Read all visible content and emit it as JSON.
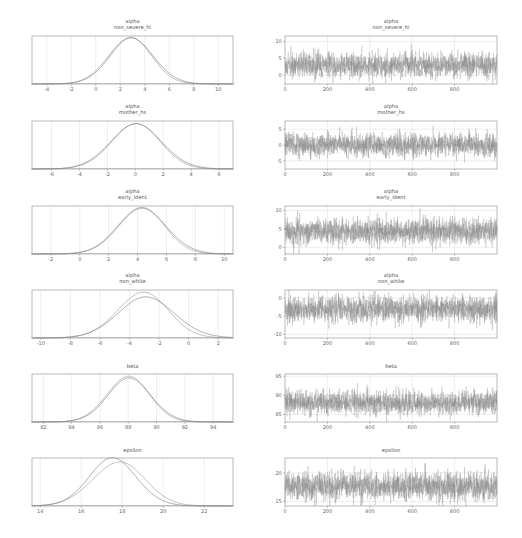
{
  "figure": {
    "width": 522,
    "height": 538,
    "background": "#ffffff",
    "rows": 6,
    "columns": 2,
    "column_kinds": [
      "kde",
      "trace"
    ]
  },
  "style": {
    "frame_color": "#8a8a8a",
    "grid_color": "#d8d8d8",
    "text_color": "#555555",
    "tick_color": "#666666",
    "chain_colors": [
      "#9a9a9a",
      "#7e7e7e"
    ]
  },
  "chart_data": [
    {
      "type": "line",
      "panel": "kde",
      "row": 0,
      "title": "alpha\nnon_severe_hi",
      "title_lines": [
        "alpha",
        "non_severe_hi"
      ],
      "xlabel": "",
      "ylabel": "",
      "xlim": [
        -5.2,
        11.2
      ],
      "ylim": [
        0,
        0.235
      ],
      "xticks": [
        -4,
        -2,
        0,
        2,
        4,
        6,
        8,
        10
      ],
      "xticklabels": [
        "-4",
        "-2",
        "0",
        "2",
        "4",
        "6",
        "8",
        "10"
      ],
      "grid": true,
      "series": [
        {
          "name": "chain 0",
          "kind": "normal-kde",
          "mean": 2.75,
          "sd": 1.75,
          "peak": 0.228
        },
        {
          "name": "chain 1",
          "kind": "normal-kde",
          "mean": 2.95,
          "sd": 1.82,
          "peak": 0.219
        }
      ]
    },
    {
      "type": "line",
      "panel": "trace",
      "row": 0,
      "title": "alpha\nnon_severe_hi",
      "title_lines": [
        "alpha",
        "non_severe_hi"
      ],
      "xlabel": "",
      "ylabel": "",
      "xlim": [
        0,
        1000
      ],
      "ylim": [
        -2.6,
        11.6
      ],
      "xticks": [
        0,
        200,
        400,
        600,
        800
      ],
      "xticklabels": [
        "0",
        "200",
        "400",
        "600",
        "800"
      ],
      "yticks": [
        0,
        5,
        10
      ],
      "yticklabels": [
        "0",
        "5",
        "10"
      ],
      "grid": true,
      "series": [
        {
          "name": "chain 0",
          "kind": "noise",
          "mean": 2.75,
          "sd": 1.75,
          "n": 1000,
          "seed": 11
        },
        {
          "name": "chain 1",
          "kind": "noise",
          "mean": 2.95,
          "sd": 1.82,
          "n": 1000,
          "seed": 12
        }
      ]
    },
    {
      "type": "line",
      "panel": "kde",
      "row": 1,
      "title": "alpha\nmother_hs",
      "title_lines": [
        "alpha",
        "mother_hs"
      ],
      "xlabel": "",
      "ylabel": "",
      "xlim": [
        -7.4,
        7.0
      ],
      "ylim": [
        0,
        0.25
      ],
      "xticks": [
        -6,
        -4,
        -2,
        0,
        2,
        4,
        6
      ],
      "xticklabels": [
        "-6",
        "-4",
        "-2",
        "0",
        "2",
        "4",
        "6"
      ],
      "grid": true,
      "series": [
        {
          "name": "chain 0",
          "kind": "normal-kde",
          "mean": -0.05,
          "sd": 1.78,
          "peak": 0.236
        },
        {
          "name": "chain 1",
          "kind": "normal-kde",
          "mean": 0.12,
          "sd": 1.84,
          "peak": 0.229
        }
      ]
    },
    {
      "type": "line",
      "panel": "trace",
      "row": 1,
      "title": "alpha\nmother_hs",
      "title_lines": [
        "alpha",
        "mother_hs"
      ],
      "xlabel": "",
      "ylabel": "",
      "xlim": [
        0,
        1000
      ],
      "ylim": [
        -7.6,
        7.6
      ],
      "xticks": [
        0,
        200,
        400,
        600,
        800
      ],
      "xticklabels": [
        "0",
        "200",
        "400",
        "600",
        "800"
      ],
      "yticks": [
        -5,
        0,
        5
      ],
      "yticklabels": [
        "-5",
        "0",
        "5"
      ],
      "grid": true,
      "series": [
        {
          "name": "chain 0",
          "kind": "noise",
          "mean": -0.05,
          "sd": 1.78,
          "n": 1000,
          "seed": 21
        },
        {
          "name": "chain 1",
          "kind": "noise",
          "mean": 0.12,
          "sd": 1.84,
          "n": 1000,
          "seed": 22
        }
      ]
    },
    {
      "type": "line",
      "panel": "kde",
      "row": 2,
      "title": "alpha\nearly_ident",
      "title_lines": [
        "alpha",
        "early_ident"
      ],
      "xlabel": "",
      "ylabel": "",
      "xlim": [
        -3.3,
        10.6
      ],
      "ylim": [
        0,
        0.26
      ],
      "xticks": [
        -2,
        0,
        2,
        4,
        6,
        8,
        10
      ],
      "xticklabels": [
        "-2",
        "0",
        "2",
        "4",
        "6",
        "8",
        "10"
      ],
      "grid": true,
      "series": [
        {
          "name": "chain 0",
          "kind": "normal-kde",
          "mean": 4.2,
          "sd": 1.62,
          "peak": 0.252
        },
        {
          "name": "chain 1",
          "kind": "normal-kde",
          "mean": 4.35,
          "sd": 1.7,
          "peak": 0.241
        }
      ]
    },
    {
      "type": "line",
      "panel": "trace",
      "row": 2,
      "title": "alpha\nearly_ident",
      "title_lines": [
        "alpha",
        "early_ident"
      ],
      "xlabel": "",
      "ylabel": "",
      "xlim": [
        0,
        1000
      ],
      "ylim": [
        -1.8,
        11.2
      ],
      "xticks": [
        0,
        200,
        400,
        600,
        800
      ],
      "xticklabels": [
        "0",
        "200",
        "400",
        "600",
        "800"
      ],
      "yticks": [
        0,
        5,
        10
      ],
      "yticklabels": [
        "0",
        "5",
        "10"
      ],
      "grid": true,
      "series": [
        {
          "name": "chain 0",
          "kind": "noise",
          "mean": 4.2,
          "sd": 1.62,
          "n": 1000,
          "seed": 31
        },
        {
          "name": "chain 1",
          "kind": "noise",
          "mean": 4.35,
          "sd": 1.7,
          "n": 1000,
          "seed": 32
        }
      ]
    },
    {
      "type": "line",
      "panel": "kde",
      "row": 3,
      "title": "alpha\nnon_white",
      "title_lines": [
        "alpha",
        "non_white"
      ],
      "xlabel": "",
      "ylabel": "",
      "xlim": [
        -10.6,
        3.0
      ],
      "ylim": [
        0,
        0.25
      ],
      "xticks": [
        -10,
        -8,
        -6,
        -4,
        -2,
        0,
        2
      ],
      "xticklabels": [
        "-10",
        "-8",
        "-6",
        "-4",
        "-2",
        "0",
        "2"
      ],
      "grid": true,
      "series": [
        {
          "name": "chain 0",
          "kind": "normal-kde",
          "mean": -3.15,
          "sd": 1.72,
          "peak": 0.238
        },
        {
          "name": "chain 1",
          "kind": "normal-kde",
          "mean": -2.85,
          "sd": 1.95,
          "peak": 0.208
        }
      ]
    },
    {
      "type": "line",
      "panel": "trace",
      "row": 3,
      "title": "alpha\nnon_white",
      "title_lines": [
        "alpha",
        "non_white"
      ],
      "xlabel": "",
      "ylabel": "",
      "xlim": [
        0,
        1000
      ],
      "ylim": [
        -11.0,
        2.2
      ],
      "xticks": [
        0,
        200,
        400,
        600,
        800
      ],
      "xticklabels": [
        "0",
        "200",
        "400",
        "600",
        "800"
      ],
      "yticks": [
        -10,
        -5,
        0
      ],
      "yticklabels": [
        "-10",
        "-5",
        "0"
      ],
      "grid": true,
      "series": [
        {
          "name": "chain 0",
          "kind": "noise",
          "mean": -3.15,
          "sd": 1.72,
          "n": 1000,
          "seed": 41
        },
        {
          "name": "chain 1",
          "kind": "noise",
          "mean": -2.85,
          "sd": 1.95,
          "n": 1000,
          "seed": 42
        }
      ]
    },
    {
      "type": "line",
      "panel": "kde",
      "row": 4,
      "title": "beta",
      "title_lines": [
        "beta"
      ],
      "xlabel": "",
      "ylabel": "",
      "xlim": [
        81.2,
        95.4
      ],
      "ylim": [
        0,
        0.32
      ],
      "xticks": [
        82,
        84,
        86,
        88,
        90,
        92,
        94
      ],
      "xticklabels": [
        "82",
        "84",
        "86",
        "88",
        "90",
        "92",
        "94"
      ],
      "grid": true,
      "series": [
        {
          "name": "chain 0",
          "kind": "normal-kde",
          "mean": 87.95,
          "sd": 1.5,
          "peak": 0.305
        },
        {
          "name": "chain 1",
          "kind": "normal-kde",
          "mean": 88.1,
          "sd": 1.56,
          "peak": 0.285
        }
      ]
    },
    {
      "type": "line",
      "panel": "trace",
      "row": 4,
      "title": "beta",
      "title_lines": [
        "beta"
      ],
      "xlabel": "",
      "ylabel": "",
      "xlim": [
        0,
        1000
      ],
      "ylim": [
        83.0,
        95.6
      ],
      "xticks": [
        0,
        200,
        400,
        600,
        800
      ],
      "xticklabels": [
        "0",
        "200",
        "400",
        "600",
        "800"
      ],
      "yticks": [
        85,
        90,
        95
      ],
      "yticklabels": [
        "85",
        "90",
        "95"
      ],
      "grid": true,
      "series": [
        {
          "name": "chain 0",
          "kind": "noise",
          "mean": 87.95,
          "sd": 1.5,
          "n": 1000,
          "seed": 51
        },
        {
          "name": "chain 1",
          "kind": "noise",
          "mean": 88.1,
          "sd": 1.56,
          "n": 1000,
          "seed": 52
        }
      ]
    },
    {
      "type": "line",
      "panel": "kde",
      "row": 5,
      "title": "epsilon",
      "title_lines": [
        "epsilon"
      ],
      "xlabel": "",
      "ylabel": "",
      "xlim": [
        13.6,
        23.4
      ],
      "ylim": [
        0,
        0.42
      ],
      "xticks": [
        14,
        16,
        18,
        20,
        22
      ],
      "xticklabels": [
        "14",
        "16",
        "18",
        "20",
        "22"
      ],
      "grid": true,
      "series": [
        {
          "name": "chain 0",
          "kind": "normal-kde",
          "mean": 17.8,
          "sd": 1.28,
          "peak": 0.385
        },
        {
          "name": "chain 1",
          "kind": "normal-kde",
          "mean": 17.55,
          "sd": 1.18,
          "peak": 0.41
        }
      ]
    },
    {
      "type": "line",
      "panel": "trace",
      "row": 5,
      "title": "epsilon",
      "title_lines": [
        "epsilon"
      ],
      "xlabel": "",
      "ylabel": "",
      "xlim": [
        0,
        1000
      ],
      "ylim": [
        14.2,
        22.6
      ],
      "xticks": [
        0,
        200,
        400,
        600,
        800
      ],
      "xticklabels": [
        "0",
        "200",
        "400",
        "600",
        "800"
      ],
      "yticks": [
        15,
        20
      ],
      "yticklabels": [
        "15",
        "20"
      ],
      "grid": true,
      "series": [
        {
          "name": "chain 0",
          "kind": "noise",
          "mean": 17.8,
          "sd": 1.28,
          "n": 1000,
          "seed": 61
        },
        {
          "name": "chain 1",
          "kind": "noise",
          "mean": 17.55,
          "sd": 1.18,
          "n": 1000,
          "seed": 62
        }
      ]
    }
  ]
}
